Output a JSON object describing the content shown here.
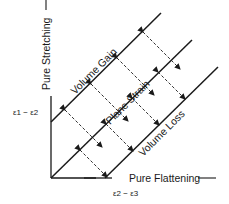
{
  "diagram": {
    "y_axis_label": "Pure Stretching",
    "x_axis_label": "Pure Flattening",
    "y_axis_expr": "ε1 − ε2",
    "x_axis_expr": "ε2 − ε3",
    "lines": [
      {
        "label": "Volume Gain"
      },
      {
        "label": "Plane Strain"
      },
      {
        "label": "Volume Loss"
      }
    ],
    "colors": {
      "line": "#1a1a1a",
      "background": "#ffffff"
    }
  }
}
